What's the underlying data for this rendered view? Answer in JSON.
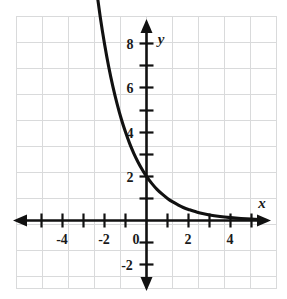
{
  "chart_data": {
    "type": "line",
    "title": "",
    "xlabel": "x",
    "ylabel": "y",
    "grid": true,
    "legend": "none",
    "xlim": [
      -5.9,
      6.0
    ],
    "ylim": [
      -3.4,
      9.4
    ],
    "x_ticks": [
      -5,
      -4,
      -3,
      -2,
      -1,
      0,
      1,
      2,
      3,
      4,
      5
    ],
    "y_ticks": [
      -3,
      -2,
      -1,
      1,
      2,
      3,
      4,
      5,
      6,
      7,
      8,
      9
    ],
    "x_tick_labels": [
      "-4",
      "-2",
      "0",
      "2",
      "4"
    ],
    "x_tick_label_values": [
      -4,
      -2,
      0,
      2,
      4
    ],
    "y_tick_labels": [
      "8",
      "6",
      "4",
      "2",
      "-2"
    ],
    "y_tick_label_values": [
      8,
      6,
      4,
      2,
      -2
    ],
    "series": [
      {
        "name": "exponential-decay",
        "equation": "y = 2 * (1/2)^x",
        "color": "#111111",
        "arrow_start": true,
        "arrow_end": false,
        "x": [
          -2.45,
          -2.2,
          -2.0,
          -1.8,
          -1.6,
          -1.4,
          -1.2,
          -1.0,
          -0.8,
          -0.6,
          -0.4,
          -0.2,
          0.0,
          0.25,
          0.5,
          0.75,
          1.0,
          1.25,
          1.5,
          1.75,
          2.0,
          2.5,
          3.0,
          3.5,
          4.0,
          4.5,
          5.0,
          5.5
        ],
        "y": [
          10.94,
          9.19,
          8.0,
          6.96,
          6.06,
          5.28,
          4.59,
          4.0,
          3.48,
          3.03,
          2.64,
          2.3,
          2.0,
          1.68,
          1.41,
          1.19,
          1.0,
          0.84,
          0.71,
          0.59,
          0.5,
          0.35,
          0.25,
          0.18,
          0.13,
          0.09,
          0.06,
          0.04
        ]
      }
    ],
    "key_points": [
      {
        "label": "y-intercept",
        "x": 0,
        "y": 2
      }
    ]
  },
  "colors": {
    "curve": "#111111",
    "axis": "#111111",
    "grid": "#d9dadb",
    "plot_border": "#d0d1d2",
    "background": "#ffffff",
    "text": "#1a1a1a"
  }
}
